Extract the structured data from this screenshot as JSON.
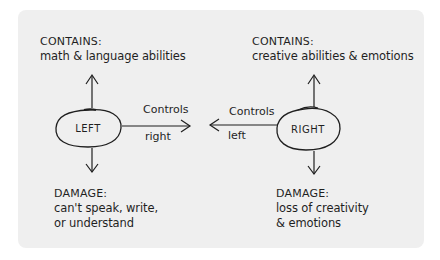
{
  "diagram": {
    "type": "concept-map",
    "background_color": "#efefef",
    "ink_color": "#1f1f1f",
    "nodes": [
      {
        "id": "left",
        "label": "LEFT",
        "contains_heading": "CONTAINS:",
        "contains_text": "math & language abilities",
        "damage_heading": "DAMAGE:",
        "damage_lines": [
          "can't speak, write,",
          "or understand"
        ]
      },
      {
        "id": "right",
        "label": "RIGHT",
        "contains_heading": "CONTAINS:",
        "contains_text": "creative abilities & emotions",
        "damage_heading": "DAMAGE:",
        "damage_lines": [
          "loss of creativity",
          "& emotions"
        ]
      }
    ],
    "edges": [
      {
        "from": "left",
        "to": "right",
        "label_top": "Controls",
        "label_bottom": "right"
      },
      {
        "from": "right",
        "to": "left",
        "label_top": "Controls",
        "label_bottom": "left"
      }
    ]
  }
}
